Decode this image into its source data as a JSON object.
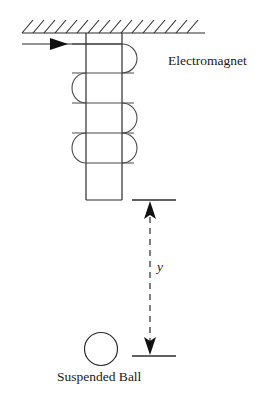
{
  "figure": {
    "type": "physics-schematic",
    "title_visible": false,
    "background_color": "#ffffff",
    "stroke_color": "#2b2b2b",
    "labels": {
      "electromagnet": "Electromagnet",
      "suspended_ball": "Suspended Ball",
      "gap_distance": "y"
    },
    "ceiling": {
      "name": "hatched-ceiling",
      "line_y": 33,
      "line_x_start": 22,
      "line_x_end": 205,
      "hatch_count": 16,
      "hatch_direction": "up-right",
      "hatch_length": 13
    },
    "lead_wire": {
      "name": "current-lead-wire",
      "y": 44,
      "x_start": 22,
      "x_end": 122,
      "arrow_x": 60,
      "arrow_direction": "right"
    },
    "core": {
      "name": "electromagnet-core",
      "x_left": 86,
      "x_right": 122,
      "y_top": 33,
      "y_bottom": 200
    },
    "coil": {
      "name": "coil-winding",
      "turn_height": 30,
      "arc_radius": 11,
      "right_arcs_y": [
        44,
        103,
        133
      ],
      "left_arcs_y": [
        73,
        133
      ],
      "right_bulge_x": 134,
      "left_bulge_x": 72
    },
    "dimension": {
      "name": "gap-dimension-y",
      "line_x": 150,
      "top_y": 200,
      "bottom_y": 356,
      "extension_x_start": 132,
      "extension_x_end": 176,
      "style": "dashed-double-arrow",
      "dash_pattern": "6,5"
    },
    "ball": {
      "name": "suspended-ball",
      "center_x": 101,
      "center_y": 349,
      "radius": 16
    }
  }
}
